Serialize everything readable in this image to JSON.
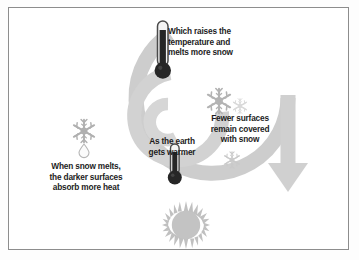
{
  "diagram": {
    "type": "cycle-spiral",
    "background_color": "#ffffff",
    "frame_color": "#8d8d8d",
    "spiral_color": "#cdcdcd",
    "text_color": "#1d1d1d",
    "steps": [
      {
        "id": "earth-warmer",
        "order": 1,
        "label": "As the earth\ngets warmer",
        "icon": "thermometer-small-icon"
      },
      {
        "id": "fewer-surfaces",
        "order": 2,
        "label": "Fewer surfaces\nremain covered\nwith snow",
        "icon": "snowflake-icon"
      },
      {
        "id": "snow-melts",
        "order": 3,
        "label": "When snow melts,\nthe darker surfaces\nabsorb more heat",
        "icon": "melting-snowflake-icon"
      },
      {
        "id": "raises-temperature",
        "order": 4,
        "label": "Which raises the\ntemperature and\nmelts more snow",
        "icon": "thermometer-large-icon"
      }
    ],
    "icons": {
      "thermometer_large": "thermometer-large-icon",
      "thermometer_small": "thermometer-small-icon",
      "snowflake_large": "snowflake-icon",
      "snowflake_small": "snowflake-small-icon",
      "snowflake_faded": "snowflake-faded-icon",
      "melting_snowflake": "melting-snowflake-icon",
      "water_drop": "water-drop-icon",
      "sun": "sun-icon",
      "arrow": "spiral-arrow-icon"
    },
    "colors": {
      "spiral_band": "#cdcdcd",
      "spiral_band_light": "#d8d8d8",
      "thermometer_fill": "#2b2b2b",
      "thermometer_tip": "#f6f6f6",
      "snowflake_dark": "#b6b6b6",
      "snowflake_light": "#dcdcdc",
      "sun_fill": "#c3c3c3",
      "arrow_fill": "#d0d0d0"
    }
  }
}
